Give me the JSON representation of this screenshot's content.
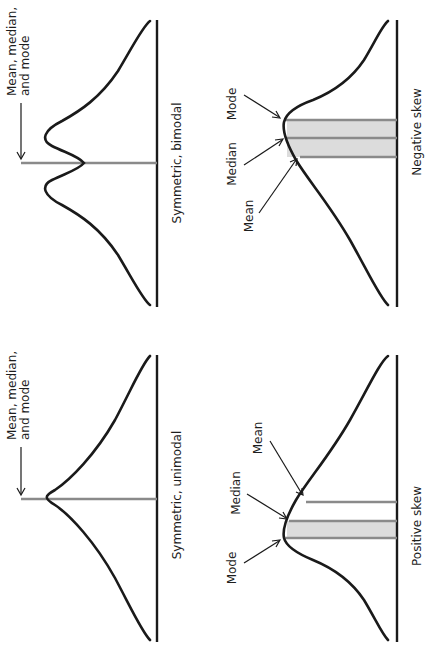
{
  "figure": {
    "orientation": "rotated 90 degrees counter-clockwise",
    "panels": [
      {
        "id": "symmetric-bimodal",
        "caption": "Symmetric, bimodal",
        "annotation_line1": "Mean, median,",
        "annotation_line2": "and mode",
        "markers": [
          "center"
        ]
      },
      {
        "id": "symmetric-unimodal",
        "caption": "Symmetric, unimodal",
        "annotation_line1": "Mean, median,",
        "annotation_line2": "and mode",
        "markers": [
          "center"
        ]
      },
      {
        "id": "negative-skew",
        "caption": "Negative skew",
        "labels": {
          "mode": "Mode",
          "median": "Median",
          "mean": "Mean"
        }
      },
      {
        "id": "positive-skew",
        "caption": "Positive skew",
        "labels": {
          "mode": "Mode",
          "median": "Median",
          "mean": "Mean"
        }
      }
    ]
  },
  "colors": {
    "curve": "#1a1a1a",
    "marker_line": "#8a8a8a",
    "band_fill": "#dcdcdc",
    "background": "#ffffff"
  }
}
